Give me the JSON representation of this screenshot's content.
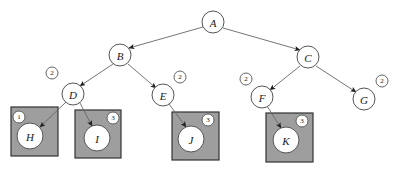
{
  "figure": {
    "type": "directed-tree-diagram",
    "width": 399,
    "height": 171,
    "background_color": "#ffffff"
  },
  "colors": {
    "node_fill": "#ffffff",
    "node_stroke": "#555555",
    "edge_stroke": "#666666",
    "box_fill": "#9e9e9e",
    "box_stroke": "#333333",
    "text": "#1a1a1a"
  },
  "nodes": [
    {
      "id": "A",
      "label": "A",
      "cx": 213,
      "cy": 22,
      "r": 11,
      "badge": null,
      "box": null
    },
    {
      "id": "B",
      "label": "B",
      "cx": 120,
      "cy": 55,
      "r": 11,
      "badge": null,
      "box": null
    },
    {
      "id": "C",
      "label": "C",
      "cx": 308,
      "cy": 57,
      "r": 11,
      "badge": null,
      "box": null
    },
    {
      "id": "D",
      "label": "D",
      "cx": 73,
      "cy": 94,
      "r": 11,
      "badge": {
        "value": "2",
        "cx": 52,
        "cy": 73,
        "r": 6
      },
      "box": null
    },
    {
      "id": "E",
      "label": "E",
      "cx": 163,
      "cy": 95,
      "r": 11,
      "badge": {
        "value": "2",
        "cx": 180,
        "cy": 77,
        "r": 6
      },
      "box": null
    },
    {
      "id": "F",
      "label": "F",
      "cx": 262,
      "cy": 97,
      "r": 11,
      "badge": {
        "value": "2",
        "cx": 246,
        "cy": 79,
        "r": 6
      },
      "box": null
    },
    {
      "id": "G",
      "label": "G",
      "cx": 364,
      "cy": 99,
      "r": 11,
      "badge": {
        "value": "2",
        "cx": 382,
        "cy": 81,
        "r": 6
      },
      "box": null
    },
    {
      "id": "H",
      "label": "H",
      "cx": 30,
      "cy": 136,
      "r": 13,
      "badge": {
        "value": "1",
        "cx": 19,
        "cy": 117,
        "r": 6
      },
      "box": {
        "x": 11,
        "y": 107,
        "w": 47,
        "h": 49
      }
    },
    {
      "id": "I",
      "label": "I",
      "cx": 97,
      "cy": 138,
      "r": 13,
      "badge": {
        "value": "3",
        "cx": 113,
        "cy": 118,
        "r": 6
      },
      "box": {
        "x": 75,
        "y": 110,
        "w": 46,
        "h": 48
      }
    },
    {
      "id": "J",
      "label": "J",
      "cx": 191,
      "cy": 139,
      "r": 13,
      "badge": {
        "value": "3",
        "cx": 208,
        "cy": 120,
        "r": 6
      },
      "box": {
        "x": 172,
        "y": 112,
        "w": 47,
        "h": 48
      }
    },
    {
      "id": "K",
      "label": "K",
      "cx": 286,
      "cy": 140,
      "r": 13,
      "badge": {
        "value": "3",
        "cx": 302,
        "cy": 121,
        "r": 6
      },
      "box": {
        "x": 266,
        "y": 113,
        "w": 47,
        "h": 49
      }
    }
  ],
  "edges": [
    {
      "from": "A",
      "to": "B",
      "x1": 203,
      "y1": 27,
      "x2": 129,
      "y2": 48
    },
    {
      "from": "A",
      "to": "C",
      "x1": 223,
      "y1": 28,
      "x2": 300,
      "y2": 50
    },
    {
      "from": "B",
      "to": "D",
      "x1": 113,
      "y1": 64,
      "x2": 80,
      "y2": 86
    },
    {
      "from": "B",
      "to": "E",
      "x1": 128,
      "y1": 64,
      "x2": 156,
      "y2": 88
    },
    {
      "from": "C",
      "to": "F",
      "x1": 300,
      "y1": 66,
      "x2": 270,
      "y2": 90
    },
    {
      "from": "C",
      "to": "G",
      "x1": 316,
      "y1": 66,
      "x2": 356,
      "y2": 92
    },
    {
      "from": "D",
      "to": "H",
      "x1": 66,
      "y1": 102,
      "x2": 40,
      "y2": 127
    },
    {
      "from": "D",
      "to": "I",
      "x1": 80,
      "y1": 103,
      "x2": 92,
      "y2": 126
    },
    {
      "from": "E",
      "to": "J",
      "x1": 169,
      "y1": 104,
      "x2": 186,
      "y2": 127
    },
    {
      "from": "F",
      "to": "K",
      "x1": 267,
      "y1": 106,
      "x2": 281,
      "y2": 128
    }
  ]
}
